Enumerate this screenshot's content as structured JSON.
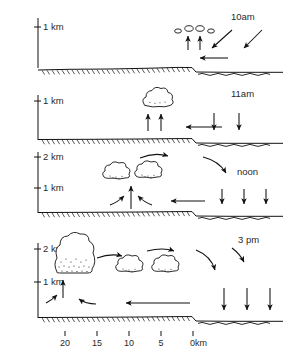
{
  "figure": {
    "orientation": "land on left, sea on right",
    "ink_color": "#111111",
    "background_color": "#ffffff"
  },
  "x_axis": {
    "label_suffix": "km",
    "ticks": [
      {
        "value": 20,
        "label": "20",
        "x": 65
      },
      {
        "value": 15,
        "label": "15",
        "x": 97
      },
      {
        "value": 10,
        "label": "10",
        "x": 129
      },
      {
        "value": 5,
        "label": "5",
        "x": 161
      },
      {
        "value": 0,
        "label": "0km",
        "x": 193
      }
    ],
    "direction": "distance inland decreasing toward the coast at 0 km"
  },
  "panels": [
    {
      "id": "panel-10am",
      "time_label": "10am",
      "y_axis_labels": [
        "1 km"
      ],
      "clouds": [
        {
          "type": "tiny-puff",
          "x": 178,
          "y": 30
        },
        {
          "type": "tiny-puff",
          "x": 188,
          "y": 28
        },
        {
          "type": "tiny-puff",
          "x": 198,
          "y": 28
        },
        {
          "type": "tiny-puff",
          "x": 208,
          "y": 30
        }
      ],
      "updraft_arrows": 2,
      "onshore_arrows": 1,
      "subsidence_arrows": 0,
      "aloft_return_arrows": 2,
      "description": "Small fair-weather cumulus begin to form inland; weak sea breeze starts onshore."
    },
    {
      "id": "panel-11am",
      "time_label": "11am",
      "y_axis_labels": [
        "1 km"
      ],
      "clouds": [
        {
          "type": "small-cumulus",
          "x": 155,
          "y": 100
        }
      ],
      "updraft_arrows": 2,
      "onshore_arrows": 1,
      "subsidence_arrows": 2,
      "aloft_return_arrows": 0,
      "description": "A single cumulus grows over land; onshore flow strengthens and subsidence develops over water."
    },
    {
      "id": "panel-noon",
      "time_label": "noon",
      "y_axis_labels": [
        "2 km",
        "1 km"
      ],
      "clouds": [
        {
          "type": "medium-cumulus",
          "x": 116,
          "y": 173
        },
        {
          "type": "medium-cumulus",
          "x": 148,
          "y": 172
        }
      ],
      "updraft_arrows": 3,
      "onshore_arrows": 1,
      "subsidence_arrows": 3,
      "aloft_return_arrows": 2,
      "description": "Sea-breeze front moves inland; cumulus deepen past 1 km with a closed circulation aloft."
    },
    {
      "id": "panel-3pm",
      "time_label": "3 pm",
      "y_axis_labels": [
        "2 km",
        "1 km"
      ],
      "clouds": [
        {
          "type": "towering-cumulus",
          "x": 75,
          "y": 252
        },
        {
          "type": "medium-cumulus",
          "x": 130,
          "y": 264
        },
        {
          "type": "medium-cumulus",
          "x": 166,
          "y": 264
        }
      ],
      "updraft_arrows": 2,
      "onshore_arrows": 1,
      "subsidence_arrows": 3,
      "aloft_return_arrows": 2,
      "description": "Towering cumulus far inland at the sea-breeze front; mature circulation with strong subsidence offshore."
    }
  ]
}
